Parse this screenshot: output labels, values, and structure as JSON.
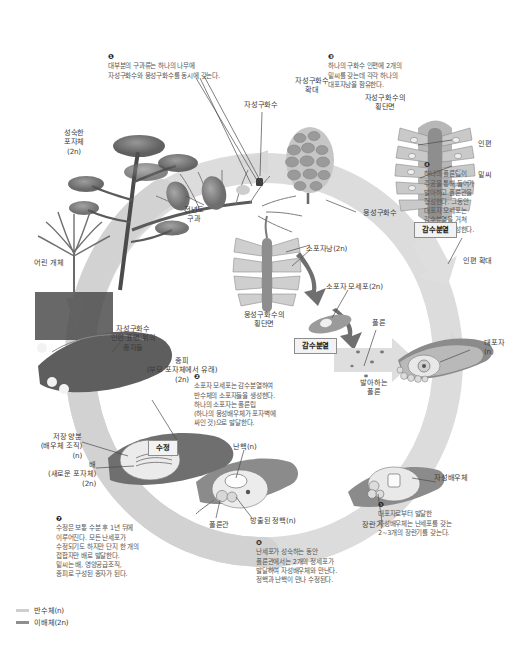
{
  "diagram": {
    "legend": [
      {
        "label": "반수체(n)",
        "color": "#cfcfcf"
      },
      {
        "label": "이배체(2n)",
        "color": "#8f8f8f"
      }
    ],
    "process_boxes": [
      {
        "id": "meiosis-female",
        "label": "감수분열"
      },
      {
        "id": "meiosis-male",
        "label": "감수분열"
      },
      {
        "id": "fertilization",
        "label": "수정"
      }
    ],
    "labels": [
      {
        "id": "mature-sporophyte",
        "text": "성숙한\n포자체\n(2n)"
      },
      {
        "id": "young-seedling",
        "text": "어린 개체"
      },
      {
        "id": "female-cone",
        "text": "자성구화수"
      },
      {
        "id": "female-cone-enlarged",
        "text": "자성구화수\n확대"
      },
      {
        "id": "previous-year-cone",
        "text": "전년도\n구과"
      },
      {
        "id": "male-cone",
        "text": "웅성구화수"
      },
      {
        "id": "female-cone-section",
        "text": "자성구화수의\n횡단면"
      },
      {
        "id": "scale",
        "text": "인편"
      },
      {
        "id": "ovule",
        "text": "밑씨"
      },
      {
        "id": "scale-enlarged",
        "text": "인편 확대"
      },
      {
        "id": "megaspore",
        "text": "대포자\n(n)"
      },
      {
        "id": "microsporangium",
        "text": "소포자낭(2n)"
      },
      {
        "id": "microspore-mother-cell",
        "text": "소포자 모세포(2n)"
      },
      {
        "id": "male-cone-section",
        "text": "웅성구화수의\n횡단면"
      },
      {
        "id": "pollen",
        "text": "폴른"
      },
      {
        "id": "germinating-pollen",
        "text": "발아하는\n폴른"
      },
      {
        "id": "female-gametophyte",
        "text": "자성배우체"
      },
      {
        "id": "archegonium",
        "text": "장란기"
      },
      {
        "id": "egg-nucleus",
        "text": "난핵(n)"
      },
      {
        "id": "released-sperm-nucleus",
        "text": "방출된 정핵(n)"
      },
      {
        "id": "pollen-tube",
        "text": "폴른관"
      },
      {
        "id": "seeds-on-scale",
        "text": "자성구화수\n인편 표면 위의\n종자들"
      },
      {
        "id": "seed-coat",
        "text": "종피\n(부모 포자체에서 유래)\n(2n)"
      },
      {
        "id": "stored-nutrients",
        "text": "저장 양분\n(배우체 조직)\n(n)"
      },
      {
        "id": "embryo",
        "text": "배\n(새로운 포자체)\n(2n)"
      }
    ],
    "notes": [
      {
        "id": "note-1",
        "num": "❶",
        "text": "대부분의 구과류는 하나의 나무에\n자성구화수와 웅성구화수를 동시에 갖는다."
      },
      {
        "id": "note-2",
        "num": "❷",
        "text": "소포자 모세포는 감수분열하여\n반수체의 소포자들을 생성한다.\n하나의 소포자는 폴른립\n(하나의 웅성배우체가 포자벽에\n싸인 것)으로 발달한다."
      },
      {
        "id": "note-3",
        "num": "❸",
        "text": "하나의 구화수 인편에 2개의\n밑씨를 갖는데 각각 하나의\n대포자낭을 함유한다."
      },
      {
        "id": "note-4",
        "num": "❹",
        "text": "하나의 폴른립이\n주공을 통해 들어가\n발아하고 폴른관을\n형성한다. 그동안\n대포자 모세포는\n감수분열을 거쳐\n대포자를 생성한다."
      },
      {
        "id": "note-5",
        "num": "❺",
        "text": "대포자로부터 발달한\n자성배우체는 난세포를 갖는\n2~3개의 장란기를 갖는다."
      },
      {
        "id": "note-6",
        "num": "❻",
        "text": "난세포가 성숙하는 동안\n폴른관에서는 2개의 정세포가\n발달하여 자성배우체와 만난다.\n정핵과 난핵이 만나 수정된다."
      },
      {
        "id": "note-7",
        "num": "❼",
        "text": "수정은 보통 수분 후 1년 뒤에\n이루어진다. 모든 난세포가\n수정되기도 하지만 단지 한 개의\n접합자만 배로 발달한다.\n밑씨는 배, 영양공급조직,\n종피로 구성된 종자가 된다."
      }
    ],
    "colors": {
      "haploid": "#cfcfcf",
      "diploid": "#8f8f8f",
      "ring_light": "#dedede",
      "ring_dark": "#bfbfbf",
      "text": "#3a3a3a",
      "line": "#4a4a4a",
      "box_fill": "#f2f2f2",
      "box_border": "#8d8d8d"
    }
  }
}
